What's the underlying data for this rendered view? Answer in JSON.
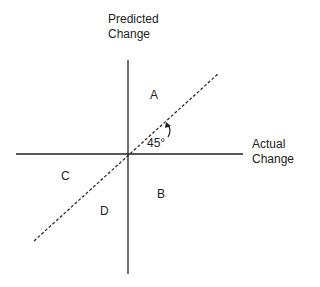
{
  "diagram": {
    "y_axis_label_line1": "Predicted",
    "y_axis_label_line2": "Change",
    "x_axis_label_line1": "Actual",
    "x_axis_label_line2": "Change",
    "angle_label": "45°",
    "regions": {
      "a": "A",
      "b": "B",
      "c": "C",
      "d": "D"
    },
    "colors": {
      "line": "#222222",
      "background": "#ffffff"
    }
  }
}
